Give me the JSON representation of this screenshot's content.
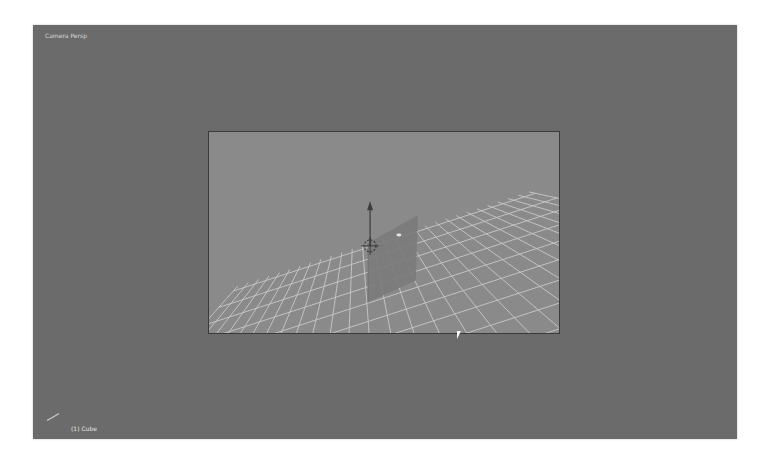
{
  "viewport": {
    "view_label": "Camera Persp",
    "object_label": "(1) Cube",
    "background_color": "#6b6b6b"
  },
  "camera_view": {
    "background_color": "#8a8a8a",
    "grid_color": "#d6d6d6",
    "plane_color": "#7a7a7a",
    "icons": [
      "transform-gizmo-icon",
      "3d-cursor-icon",
      "mouse-pointer-icon"
    ]
  }
}
